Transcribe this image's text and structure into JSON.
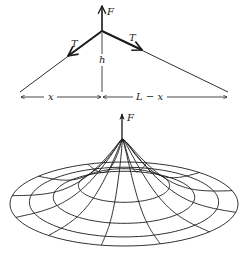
{
  "colors": {
    "ink": "#1a1a1a",
    "background": "#ffffff"
  },
  "string_diagram": {
    "apex": [
      102,
      31
    ],
    "left_end": [
      20,
      92
    ],
    "right_end": [
      228,
      92
    ],
    "force_tip": [
      102,
      5
    ],
    "dim_line_y": 97,
    "labels": {
      "force": "F",
      "tension_left": "T",
      "tension_right": "T",
      "height": "h",
      "left_length": "x",
      "right_length": "L − x"
    }
  },
  "membrane_diagram": {
    "center": [
      124,
      204
    ],
    "outer_rx": 114,
    "outer_ry": 42,
    "rings": [
      1.0,
      0.83,
      0.62,
      0.4
    ],
    "spokes": 12,
    "peak": [
      122,
      140
    ],
    "force_tip": [
      122,
      113
    ],
    "labels": {
      "force": "F"
    }
  }
}
